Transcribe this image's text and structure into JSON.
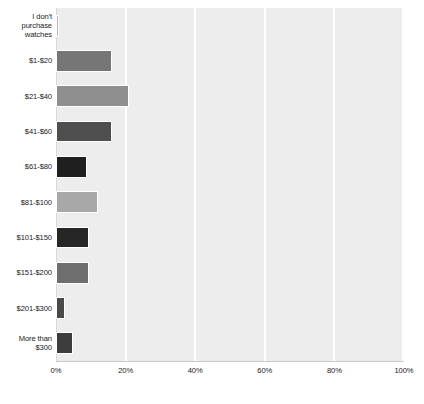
{
  "chart_data": {
    "type": "bar",
    "orientation": "horizontal",
    "title": "",
    "xlabel": "",
    "ylabel": "",
    "categories": [
      "I don't purchase watches",
      "$1-$20",
      "$21-$40",
      "$41-$60",
      "$61-$80",
      "$81-$100",
      "$101-$150",
      "$151-$200",
      "$201-$300",
      "More than $300"
    ],
    "category_lines": [
      [
        "I don't",
        "purchase",
        "watches"
      ],
      [
        "$1-$20"
      ],
      [
        "$21-$40"
      ],
      [
        "$41-$60"
      ],
      [
        "$61-$80"
      ],
      [
        "$81-$100"
      ],
      [
        "$101-$150"
      ],
      [
        "$151-$200"
      ],
      [
        "$201-$300"
      ],
      [
        "More than",
        "$300"
      ]
    ],
    "values": [
      1,
      16,
      21,
      16,
      9,
      12,
      9.5,
      9.5,
      2.5,
      5
    ],
    "bar_colors": [
      "#b5b5b5",
      "#767676",
      "#8f8f8f",
      "#4f4f4f",
      "#1f1f1f",
      "#a8a8a8",
      "#262626",
      "#6e6e6e",
      "#4a4a4a",
      "#3d3d3d"
    ],
    "xlim": [
      0,
      100
    ],
    "ylim": null,
    "xticks": [
      0,
      20,
      40,
      60,
      80,
      100
    ],
    "xtick_labels": [
      "0%",
      "20%",
      "40%",
      "60%",
      "80%",
      "100%"
    ],
    "grid": true,
    "grid_axis": "x",
    "legend": false,
    "plot_background": "#ededed",
    "gridline_color": "#ffffff",
    "figure_background": "#ffffff"
  }
}
